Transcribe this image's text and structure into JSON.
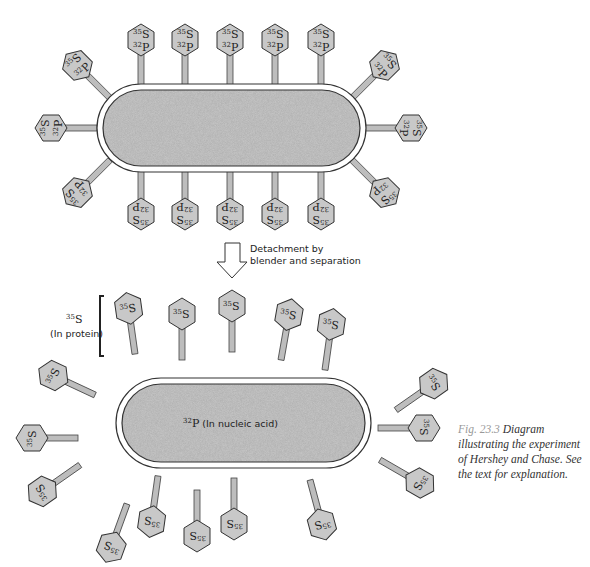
{
  "top_panel": {
    "phage_label_s": "35S",
    "phage_label_p": "32P",
    "phage_count": 18
  },
  "arrow": {
    "label_line1": "Detachment by",
    "label_line2": "blender and separation"
  },
  "bottom_panel": {
    "protein_label_mass": "35",
    "protein_label_elem": "S",
    "protein_label_sub": "(In protein)",
    "cell_label_mass": "32",
    "cell_label_elem": "P",
    "cell_label_text": " (In nucleic acid)",
    "ghost_label": "35S",
    "ghost_count": 18
  },
  "caption": {
    "figure_number": "Fig. 23.3",
    "text": "Diagram illustrating the experiment of Hershey and Chase. See the text for explanation."
  },
  "colors": {
    "phage_fill": "#c8c8c8",
    "cell_fill": "#b0b0b0",
    "outline": "#333333",
    "caption_number": "#999999"
  }
}
